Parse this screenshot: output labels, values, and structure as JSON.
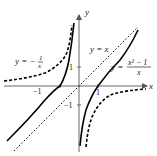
{
  "figure": {
    "axes": {
      "x_label": "x",
      "y_label": "y",
      "ticks": {
        "x_neg": "−1",
        "x_pos": "1",
        "y_pos": "1",
        "y_neg": "−1"
      }
    },
    "curves": [
      {
        "name": "main-function",
        "label_lhs": "y = ",
        "label_num": "x² − 1",
        "label_den": "x",
        "style": "solid",
        "color": "#000000"
      },
      {
        "name": "asymptote-line",
        "label": "y = x",
        "style": "dotted",
        "color": "#000000"
      },
      {
        "name": "reciprocal",
        "label_lhs": "y = −",
        "label_num": "1",
        "label_den": "x",
        "style": "dashed",
        "color": "#000000"
      }
    ],
    "colors": {
      "axis": "#555555",
      "curve": "#000000"
    }
  }
}
